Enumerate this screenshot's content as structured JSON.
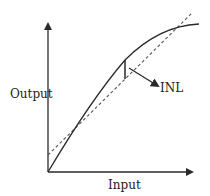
{
  "diagram": {
    "title": "",
    "labels": {
      "y_axis": "Output",
      "x_axis": "Input",
      "annotation": "INL"
    },
    "elements": {
      "actual_curve": "solid concave transfer curve",
      "ideal_line": "dashed straight line",
      "inl_marker": "vertical segment between curve and ideal line",
      "annotation_arrow": "arrow pointing to INL marker"
    },
    "colors": {
      "stroke": "#2a2a2a",
      "dashed": "#555555",
      "text": "#222222"
    }
  }
}
